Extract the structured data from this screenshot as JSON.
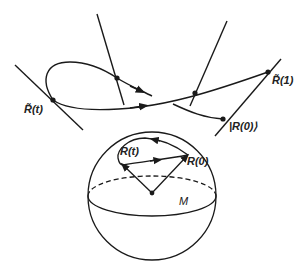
{
  "figure": {
    "labels": {
      "rt_tilde": "R̃(t)",
      "r1_tilde": "R̃(1)",
      "r0_ket": "|R(0)⟩",
      "rt": "R(t)",
      "r0": "R(0)",
      "manifold": "M"
    },
    "colors": {
      "stroke": "#1a1a1a",
      "background": "#ffffff"
    }
  }
}
